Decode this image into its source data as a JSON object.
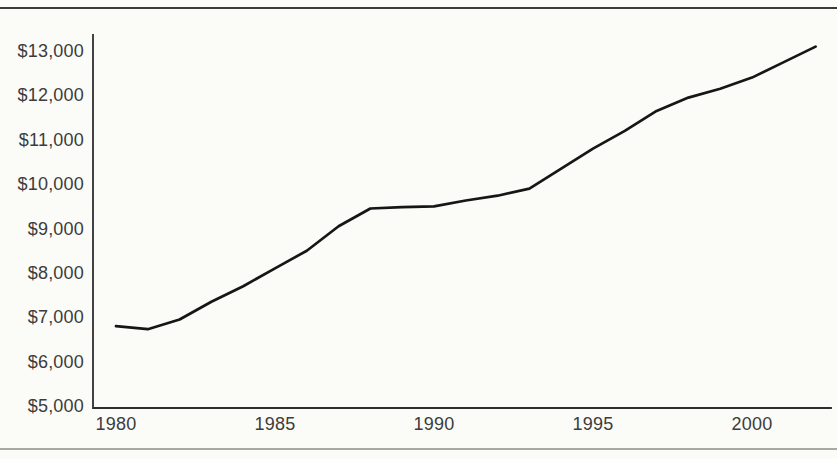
{
  "figure": {
    "background": "#fbfbf8",
    "top_rule_color": "#3a3a3a",
    "bottom_rule_color": "#a8a8a4",
    "axis_color": "#2e2e2e",
    "text_color": "#3c3c3c"
  },
  "chart_data": {
    "type": "line",
    "title": "",
    "xlabel": "",
    "ylabel": "",
    "grid": false,
    "legend": false,
    "line_color": "#161616",
    "xlim": [
      1980,
      2002
    ],
    "ylim": [
      5000,
      13000
    ],
    "x": [
      1980,
      1981,
      1982,
      1983,
      1984,
      1985,
      1986,
      1987,
      1988,
      1989,
      1990,
      1991,
      1992,
      1993,
      1994,
      1995,
      1996,
      1997,
      1998,
      1999,
      2000,
      2001,
      2002
    ],
    "values": [
      6800,
      6730,
      6950,
      7350,
      7700,
      8100,
      8500,
      9050,
      9450,
      9480,
      9500,
      9630,
      9740,
      9900,
      10350,
      10800,
      11200,
      11650,
      11950,
      12150,
      12400,
      12750,
      13100
    ],
    "series": [
      {
        "name": "dollars",
        "values": [
          6800,
          6730,
          6950,
          7350,
          7700,
          8100,
          8500,
          9050,
          9450,
          9480,
          9500,
          9630,
          9740,
          9900,
          10350,
          10800,
          11200,
          11650,
          11950,
          12150,
          12400,
          12750,
          13100
        ]
      }
    ],
    "y_ticks": [
      {
        "value": 13000,
        "label": "$13,000"
      },
      {
        "value": 12000,
        "label": "$12,000"
      },
      {
        "value": 11000,
        "label": "$11,000"
      },
      {
        "value": 10000,
        "label": "$10,000"
      },
      {
        "value": 9000,
        "label": "$9,000"
      },
      {
        "value": 8000,
        "label": "$8,000"
      },
      {
        "value": 7000,
        "label": "$7,000"
      },
      {
        "value": 6000,
        "label": "$6,000"
      },
      {
        "value": 5000,
        "label": "$5,000"
      }
    ],
    "x_ticks": [
      {
        "x": 1980,
        "label": "1980"
      },
      {
        "x": 1985,
        "label": "1985"
      },
      {
        "x": 1990,
        "label": "1990"
      },
      {
        "x": 1995,
        "label": "1995"
      },
      {
        "x": 2000,
        "label": "2000"
      }
    ]
  }
}
